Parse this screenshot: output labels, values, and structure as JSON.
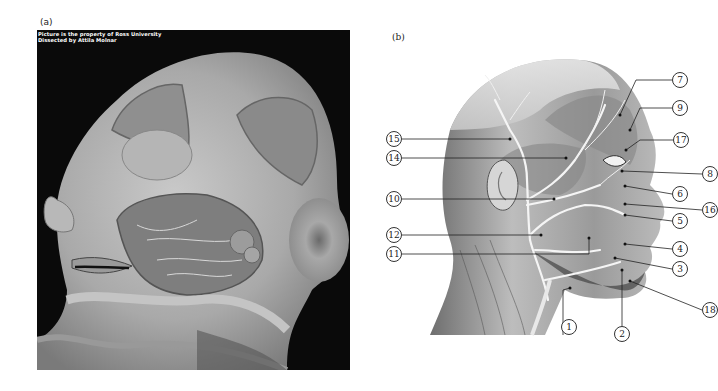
{
  "panels": {
    "a": {
      "label": "(a)",
      "credit_line1": "Picture is the property of Ross University",
      "credit_line2": "Dissected by Attila Molnar",
      "description": "Photograph of dissected human head, left lateral view, showing facial muscles, nerves and parotid region"
    },
    "b": {
      "label": "(b)",
      "description": "Illustration of head, right lateral view, showing facial nerve branches with numbered callouts"
    }
  },
  "callouts": [
    {
      "id": "1",
      "text": "1"
    },
    {
      "id": "2",
      "text": "2"
    },
    {
      "id": "3",
      "text": "3"
    },
    {
      "id": "4",
      "text": "4"
    },
    {
      "id": "5",
      "text": "5"
    },
    {
      "id": "6",
      "text": "6"
    },
    {
      "id": "7",
      "text": "7"
    },
    {
      "id": "8",
      "text": "8"
    },
    {
      "id": "9",
      "text": "9"
    },
    {
      "id": "10",
      "text": "10"
    },
    {
      "id": "11",
      "text": "11"
    },
    {
      "id": "12",
      "text": "12"
    },
    {
      "id": "14",
      "text": "14"
    },
    {
      "id": "15",
      "text": "15"
    },
    {
      "id": "16",
      "text": "16"
    },
    {
      "id": "17",
      "text": "17"
    },
    {
      "id": "18",
      "text": "18"
    }
  ]
}
